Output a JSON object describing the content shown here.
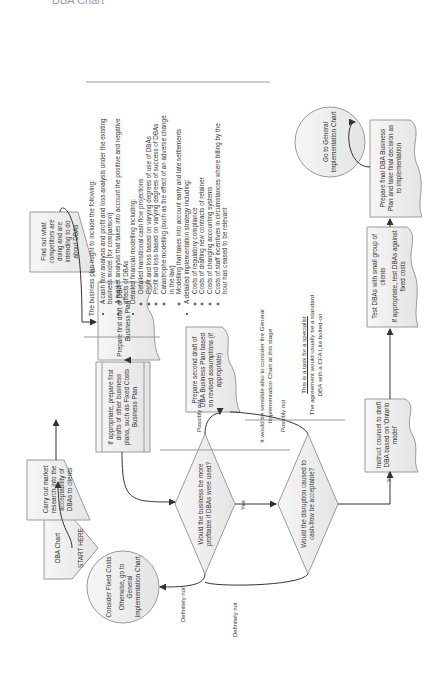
{
  "page": {
    "cutoff_title": "DBA Chart"
  },
  "nodes": {
    "start": {
      "title": "DBA Chart",
      "sub": "START HERE"
    },
    "market_research": {
      "text": "Carry out market research into the acceptability of DBAs to clients"
    },
    "competitors": {
      "text": "Find out what competitors are doing and are intending to do about DBAs"
    },
    "first_draft": {
      "text": "Prepare first draft of DBA Business Plan"
    },
    "other_plans": {
      "text": "If appropriate, prepare first drafts of other business plans, such as Fixed Costs Business Plan"
    },
    "decision_profitable": {
      "text": "Would the business be more profitable if DBAs were used?"
    },
    "decision_disruption": {
      "text": "Would the disruption caused to cash-flow be acceptable?"
    },
    "second_draft": {
      "text": "Prepare second draft of DBA Business Plan based on revised assumptions (if appropriate)"
    },
    "instruct_counsel": {
      "text": "Instruct counsel to draft DBA based on 'Ontario model'"
    },
    "test_dbas": {
      "line1": "Test DBAs with small group of clients",
      "line2": "If appropriate, test DBAs against fixed costs"
    },
    "final_plan": {
      "text": "Prepare final DBA Business Plan and take final decision as to implementation"
    },
    "go_general": {
      "text": "Go to General Implementation Chart"
    },
    "fixed_costs": {
      "line1": "Consider Fixed Costs",
      "line2": "Otherwise, go to General Implementation Chart"
    }
  },
  "edge_labels": {
    "yes_1": "Yes",
    "yes_2": "Yes",
    "possibly_not_1": "Possibly not",
    "possibly_not_2": "Possibly not",
    "definitely_not_1": "Definitely not",
    "definitely_not_2": "Definitely not"
  },
  "notes": {
    "consider_general": "It would be sensible also to consider the General Implementation Chart at this stage",
    "specialist_title": "This is a task for a specialist",
    "specialist_body": "The agreement would usually be a standard DBA with a CFA Lite bolted-on"
  },
  "business_plan_list": {
    "lead": "The business plan ought to include the following:",
    "items": [
      {
        "text": "A cash flow analysis and profit and loss analysis under the existing business model (for comparison)",
        "sub": []
      },
      {
        "text": "A market analysis that takes into account the positive and negative effects of DBAs",
        "sub": []
      },
      {
        "text": "Detailed financial modelling including:",
        "sub": [
          "Detailed transitional cash flow projections",
          "Profit and loss based on varying degrees of use of DBAs",
          "Profit and loss based on varying degrees of success of DBAs",
          "Catastrophe modelling (such as the effect of an adverse change in the law)",
          "Modelling that takes into account early and late settlements"
        ]
      },
      {
        "text": "A detailed implementation strategy including:",
        "sub": [
          "Costs of regulatory compliance",
          "Costs of drafting new contracts of retainer",
          "Costs of changing accounting systems",
          "Costs of staff incentives in circumstances where billing by the hour has ceased to be relevant"
        ]
      }
    ]
  },
  "colors": {
    "shape_fill": "#eeeeee",
    "shape_stroke": "#9a9a9a",
    "line": "#333333"
  }
}
